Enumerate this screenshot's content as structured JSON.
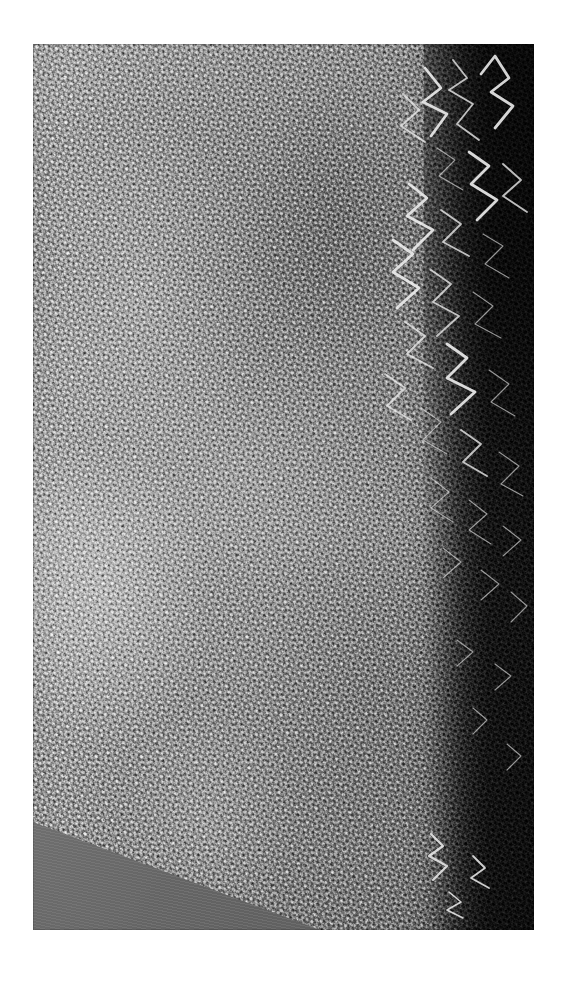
{
  "page": {
    "width": 567,
    "height": 982,
    "background_color": "#ffffff",
    "kind": "scanned-photographic-plate",
    "caption": "",
    "title": ""
  },
  "plate": {
    "name": "micrograph-plate",
    "x": 33,
    "y": 44,
    "width": 501,
    "height": 886,
    "description": "Grayscale metallurgical micrograph showing a dense acicular (needle-like) microstructure",
    "border_color": "#000000"
  },
  "regions": [
    {
      "name": "acicular-matrix",
      "label": "Acicular matrix",
      "tone": "light-to-mid gray",
      "hex_light": "#d2d2d2",
      "hex_mid": "#a2a2a2"
    },
    {
      "name": "dark-right-band",
      "label": "Dark right-edge band",
      "tone": "near-black with bright filaments",
      "hex": "#1b1b1b",
      "filament_hex": "#e8e8e8",
      "x_start_pct": 78,
      "x_end_pct": 100
    },
    {
      "name": "lower-left-wedge",
      "label": "Smooth lower-left wedge",
      "tone": "uniform mid-dark gray",
      "hex": "#6e6e6e",
      "diagonal_from": "left edge at 88% height",
      "diagonal_to": "bottom edge at 57% width"
    }
  ],
  "gradient": {
    "name": "lateral-illumination-gradient",
    "direction": "left-bright to right-dark",
    "stops": [
      "#d2d2d2",
      "#c4c4c4",
      "#ababab",
      "#9a9a9a",
      "#6f6f6f",
      "#232323"
    ]
  },
  "filaments": {
    "name": "bright-zigzag-filaments",
    "count": 26,
    "stroke_color": "#e8e8e8",
    "note": "Bright angular whisker/needle structures standing out against the dark right band"
  }
}
